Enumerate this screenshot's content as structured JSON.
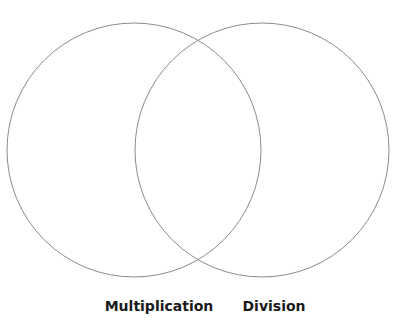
{
  "diagram": {
    "type": "venn",
    "sets": [
      {
        "id": "left",
        "label": "Multiplication",
        "cx": 134,
        "cy": 150,
        "r": 127
      },
      {
        "id": "right",
        "label": "Division",
        "cx": 262,
        "cy": 150,
        "r": 127
      }
    ],
    "stroke_color": "#8c8c8c",
    "stroke_width": 1,
    "fill_color": "none",
    "background": "#ffffff"
  }
}
